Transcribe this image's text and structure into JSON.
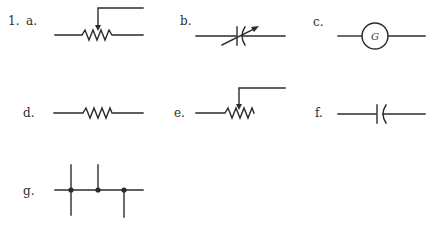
{
  "problem": {
    "number": "1.",
    "items": [
      {
        "label": "a.",
        "symbol": "potentiometer-icon"
      },
      {
        "label": "b.",
        "symbol": "variable-capacitor-icon"
      },
      {
        "label": "c.",
        "symbol": "generator-icon",
        "glyph": "G"
      },
      {
        "label": "d.",
        "symbol": "resistor-icon"
      },
      {
        "label": "e.",
        "symbol": "potentiometer-icon"
      },
      {
        "label": "f.",
        "symbol": "capacitor-icon"
      },
      {
        "label": "g.",
        "symbol": "wire-junctions-icon"
      }
    ]
  }
}
